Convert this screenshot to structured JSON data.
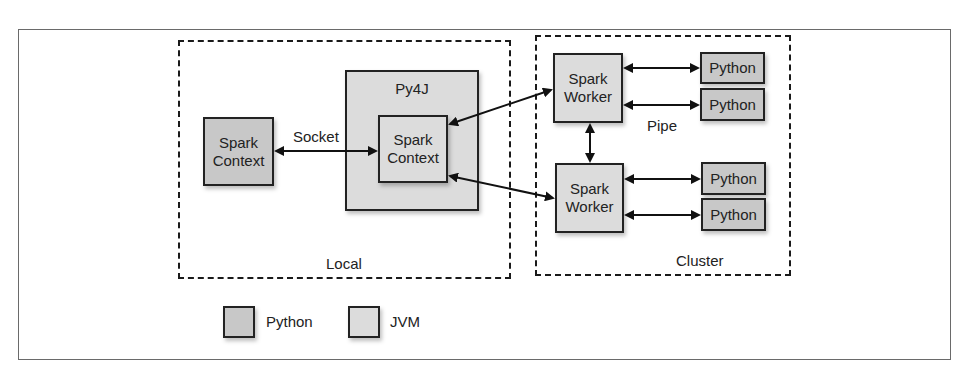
{
  "diagram": {
    "type": "architecture",
    "groups": {
      "local": {
        "label": "Local"
      },
      "cluster": {
        "label": "Cluster"
      }
    },
    "nodes": {
      "python_spark_context": {
        "line1": "Spark",
        "line2": "Context",
        "kind": "Python"
      },
      "py4j": {
        "label": "Py4J",
        "kind": "JVM"
      },
      "jvm_spark_context": {
        "line1": "Spark",
        "line2": "Context",
        "kind": "JVM"
      },
      "worker1": {
        "line1": "Spark",
        "line2": "Worker",
        "kind": "JVM"
      },
      "worker2": {
        "line1": "Spark",
        "line2": "Worker",
        "kind": "JVM"
      },
      "python1": {
        "label": "Python",
        "kind": "Python"
      },
      "python2": {
        "label": "Python",
        "kind": "Python"
      },
      "python3": {
        "label": "Python",
        "kind": "Python"
      },
      "python4": {
        "label": "Python",
        "kind": "Python"
      }
    },
    "edge_labels": {
      "socket": "Socket",
      "pipe": "Pipe"
    },
    "edges": [
      {
        "from": "python_spark_context",
        "to": "jvm_spark_context",
        "label": "Socket",
        "bidirectional": true
      },
      {
        "from": "jvm_spark_context",
        "to": "worker1",
        "bidirectional": true
      },
      {
        "from": "jvm_spark_context",
        "to": "worker2",
        "bidirectional": true
      },
      {
        "from": "worker1",
        "to": "worker2",
        "bidirectional": true
      },
      {
        "from": "worker1",
        "to": "python1",
        "bidirectional": true
      },
      {
        "from": "worker1",
        "to": "python2",
        "label": "Pipe",
        "bidirectional": true
      },
      {
        "from": "worker2",
        "to": "python3",
        "bidirectional": true
      },
      {
        "from": "worker2",
        "to": "python4",
        "bidirectional": true
      }
    ],
    "legend": [
      {
        "label": "Python",
        "color": "#c8c8c8"
      },
      {
        "label": "JVM",
        "color": "#dcdcdc"
      }
    ]
  }
}
